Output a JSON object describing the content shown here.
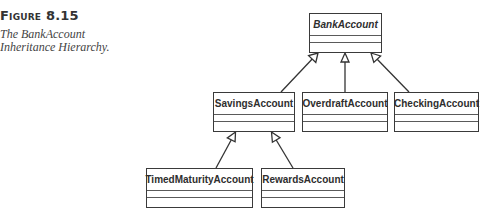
{
  "figure": {
    "label": "Figure 8.15",
    "caption_lines": [
      "The BankAccount",
      "Inheritance Hierarchy."
    ]
  },
  "diagram": {
    "type": "UML class inheritance hierarchy",
    "classes": [
      {
        "id": "bank",
        "name": "BankAccount",
        "abstract": true
      },
      {
        "id": "savings",
        "name": "SavingsAccount",
        "abstract": false
      },
      {
        "id": "overdraft",
        "name": "OverdraftAccount",
        "abstract": false
      },
      {
        "id": "checking",
        "name": "CheckingAccount",
        "abstract": false
      },
      {
        "id": "timed",
        "name": "TimedMaturityAccount",
        "abstract": false
      },
      {
        "id": "rewards",
        "name": "RewardsAccount",
        "abstract": false
      }
    ],
    "generalizations": [
      {
        "child": "SavingsAccount",
        "parent": "BankAccount"
      },
      {
        "child": "OverdraftAccount",
        "parent": "BankAccount"
      },
      {
        "child": "CheckingAccount",
        "parent": "BankAccount"
      },
      {
        "child": "TimedMaturityAccount",
        "parent": "SavingsAccount"
      },
      {
        "child": "RewardsAccount",
        "parent": "SavingsAccount"
      }
    ]
  }
}
